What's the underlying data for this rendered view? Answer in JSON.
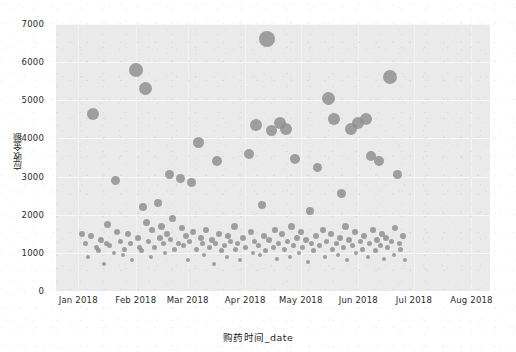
{
  "chart_data": {
    "type": "scatter",
    "title": "",
    "xlabel": "购药时间_date",
    "ylabel": "应收金额",
    "grid": true,
    "legend": "none",
    "marker_color": "#8e8e8e",
    "panel_color": "#eaeaea",
    "figure_color": "#ffffff",
    "xlim": [
      "2017-12-20",
      "2018-08-10"
    ],
    "ylim": [
      0,
      7000
    ],
    "y_ticks": [
      0,
      1000,
      2000,
      3000,
      4000,
      5000,
      6000,
      7000
    ],
    "y_tick_labels": [
      "0",
      "1000",
      "2000",
      "3000",
      "4000",
      "5000",
      "6000",
      "7000"
    ],
    "x_ticks": [
      "2018-01-01",
      "2018-02-01",
      "2018-03-01",
      "2018-04-01",
      "2018-05-01",
      "2018-06-01",
      "2018-07-01",
      "2018-08-01"
    ],
    "x_tick_labels": [
      "Jan 2018",
      "Feb 2018",
      "Mar 2018",
      "Apr 2018",
      "May 2018",
      "Jun 2018",
      "Jul 2018",
      "Aug 2018"
    ],
    "size_encodes": "应收金额",
    "points": [
      {
        "x": 3,
        "y": 1500,
        "s": 6
      },
      {
        "x": 5,
        "y": 1250,
        "s": 5
      },
      {
        "x": 6,
        "y": 900,
        "s": 4
      },
      {
        "x": 8,
        "y": 1450,
        "s": 6
      },
      {
        "x": 9,
        "y": 4650,
        "s": 12
      },
      {
        "x": 11,
        "y": 1150,
        "s": 5
      },
      {
        "x": 12,
        "y": 1050,
        "s": 5
      },
      {
        "x": 13,
        "y": 1350,
        "s": 6
      },
      {
        "x": 15,
        "y": 700,
        "s": 4
      },
      {
        "x": 16,
        "y": 1250,
        "s": 5
      },
      {
        "x": 17,
        "y": 1750,
        "s": 7
      },
      {
        "x": 18,
        "y": 1200,
        "s": 5
      },
      {
        "x": 20,
        "y": 1000,
        "s": 4
      },
      {
        "x": 21,
        "y": 2900,
        "s": 9
      },
      {
        "x": 22,
        "y": 1550,
        "s": 6
      },
      {
        "x": 24,
        "y": 1300,
        "s": 5
      },
      {
        "x": 25,
        "y": 950,
        "s": 4
      },
      {
        "x": 26,
        "y": 1100,
        "s": 5
      },
      {
        "x": 28,
        "y": 1500,
        "s": 6
      },
      {
        "x": 29,
        "y": 1250,
        "s": 5
      },
      {
        "x": 30,
        "y": 800,
        "s": 4
      },
      {
        "x": 32,
        "y": 5800,
        "s": 14
      },
      {
        "x": 33,
        "y": 1400,
        "s": 6
      },
      {
        "x": 34,
        "y": 1150,
        "s": 5
      },
      {
        "x": 35,
        "y": 1050,
        "s": 5
      },
      {
        "x": 36,
        "y": 2200,
        "s": 8
      },
      {
        "x": 37,
        "y": 5300,
        "s": 13
      },
      {
        "x": 38,
        "y": 1800,
        "s": 7
      },
      {
        "x": 39,
        "y": 1300,
        "s": 5
      },
      {
        "x": 40,
        "y": 900,
        "s": 4
      },
      {
        "x": 41,
        "y": 1600,
        "s": 6
      },
      {
        "x": 42,
        "y": 1150,
        "s": 5
      },
      {
        "x": 44,
        "y": 2300,
        "s": 8
      },
      {
        "x": 45,
        "y": 1400,
        "s": 6
      },
      {
        "x": 46,
        "y": 1700,
        "s": 7
      },
      {
        "x": 47,
        "y": 1250,
        "s": 5
      },
      {
        "x": 48,
        "y": 1000,
        "s": 4
      },
      {
        "x": 49,
        "y": 1500,
        "s": 6
      },
      {
        "x": 50,
        "y": 3050,
        "s": 9
      },
      {
        "x": 51,
        "y": 1350,
        "s": 5
      },
      {
        "x": 52,
        "y": 1900,
        "s": 7
      },
      {
        "x": 53,
        "y": 1100,
        "s": 5
      },
      {
        "x": 55,
        "y": 1250,
        "s": 5
      },
      {
        "x": 56,
        "y": 2950,
        "s": 9
      },
      {
        "x": 57,
        "y": 1650,
        "s": 6
      },
      {
        "x": 58,
        "y": 1200,
        "s": 5
      },
      {
        "x": 59,
        "y": 1450,
        "s": 6
      },
      {
        "x": 60,
        "y": 800,
        "s": 4
      },
      {
        "x": 61,
        "y": 1300,
        "s": 5
      },
      {
        "x": 62,
        "y": 2850,
        "s": 9
      },
      {
        "x": 63,
        "y": 1550,
        "s": 6
      },
      {
        "x": 65,
        "y": 1100,
        "s": 5
      },
      {
        "x": 66,
        "y": 3900,
        "s": 11
      },
      {
        "x": 67,
        "y": 1400,
        "s": 6
      },
      {
        "x": 68,
        "y": 1250,
        "s": 5
      },
      {
        "x": 69,
        "y": 950,
        "s": 4
      },
      {
        "x": 70,
        "y": 1600,
        "s": 6
      },
      {
        "x": 72,
        "y": 1150,
        "s": 5
      },
      {
        "x": 73,
        "y": 1350,
        "s": 6
      },
      {
        "x": 74,
        "y": 700,
        "s": 4
      },
      {
        "x": 75,
        "y": 1250,
        "s": 5
      },
      {
        "x": 76,
        "y": 3400,
        "s": 10
      },
      {
        "x": 77,
        "y": 1500,
        "s": 6
      },
      {
        "x": 78,
        "y": 1050,
        "s": 5
      },
      {
        "x": 80,
        "y": 1200,
        "s": 5
      },
      {
        "x": 81,
        "y": 900,
        "s": 4
      },
      {
        "x": 82,
        "y": 1450,
        "s": 6
      },
      {
        "x": 83,
        "y": 1300,
        "s": 5
      },
      {
        "x": 85,
        "y": 1700,
        "s": 7
      },
      {
        "x": 86,
        "y": 1100,
        "s": 5
      },
      {
        "x": 87,
        "y": 1250,
        "s": 5
      },
      {
        "x": 88,
        "y": 800,
        "s": 4
      },
      {
        "x": 90,
        "y": 1400,
        "s": 6
      },
      {
        "x": 91,
        "y": 1150,
        "s": 5
      },
      {
        "x": 93,
        "y": 3600,
        "s": 10
      },
      {
        "x": 94,
        "y": 1550,
        "s": 6
      },
      {
        "x": 95,
        "y": 1000,
        "s": 4
      },
      {
        "x": 96,
        "y": 1300,
        "s": 5
      },
      {
        "x": 97,
        "y": 4350,
        "s": 12
      },
      {
        "x": 98,
        "y": 1200,
        "s": 5
      },
      {
        "x": 99,
        "y": 950,
        "s": 4
      },
      {
        "x": 100,
        "y": 2250,
        "s": 8
      },
      {
        "x": 101,
        "y": 1450,
        "s": 6
      },
      {
        "x": 102,
        "y": 1050,
        "s": 5
      },
      {
        "x": 103,
        "y": 6600,
        "s": 16
      },
      {
        "x": 104,
        "y": 1350,
        "s": 6
      },
      {
        "x": 105,
        "y": 4200,
        "s": 11
      },
      {
        "x": 106,
        "y": 1150,
        "s": 5
      },
      {
        "x": 107,
        "y": 1600,
        "s": 6
      },
      {
        "x": 108,
        "y": 850,
        "s": 4
      },
      {
        "x": 109,
        "y": 1250,
        "s": 5
      },
      {
        "x": 110,
        "y": 4400,
        "s": 12
      },
      {
        "x": 111,
        "y": 1500,
        "s": 6
      },
      {
        "x": 112,
        "y": 1100,
        "s": 5
      },
      {
        "x": 113,
        "y": 4250,
        "s": 12
      },
      {
        "x": 114,
        "y": 1300,
        "s": 5
      },
      {
        "x": 115,
        "y": 900,
        "s": 4
      },
      {
        "x": 116,
        "y": 1700,
        "s": 7
      },
      {
        "x": 117,
        "y": 1200,
        "s": 5
      },
      {
        "x": 118,
        "y": 3450,
        "s": 10
      },
      {
        "x": 119,
        "y": 1400,
        "s": 6
      },
      {
        "x": 120,
        "y": 1000,
        "s": 4
      },
      {
        "x": 121,
        "y": 1550,
        "s": 6
      },
      {
        "x": 122,
        "y": 1150,
        "s": 5
      },
      {
        "x": 124,
        "y": 1350,
        "s": 6
      },
      {
        "x": 125,
        "y": 750,
        "s": 4
      },
      {
        "x": 126,
        "y": 2100,
        "s": 8
      },
      {
        "x": 127,
        "y": 1250,
        "s": 5
      },
      {
        "x": 128,
        "y": 1050,
        "s": 5
      },
      {
        "x": 129,
        "y": 1450,
        "s": 6
      },
      {
        "x": 130,
        "y": 3250,
        "s": 9
      },
      {
        "x": 131,
        "y": 1200,
        "s": 5
      },
      {
        "x": 133,
        "y": 1600,
        "s": 6
      },
      {
        "x": 134,
        "y": 900,
        "s": 4
      },
      {
        "x": 135,
        "y": 1300,
        "s": 5
      },
      {
        "x": 136,
        "y": 5050,
        "s": 13
      },
      {
        "x": 137,
        "y": 1500,
        "s": 6
      },
      {
        "x": 138,
        "y": 1100,
        "s": 5
      },
      {
        "x": 139,
        "y": 4500,
        "s": 12
      },
      {
        "x": 140,
        "y": 1250,
        "s": 5
      },
      {
        "x": 141,
        "y": 950,
        "s": 4
      },
      {
        "x": 142,
        "y": 1400,
        "s": 6
      },
      {
        "x": 143,
        "y": 2550,
        "s": 9
      },
      {
        "x": 144,
        "y": 1150,
        "s": 5
      },
      {
        "x": 145,
        "y": 1700,
        "s": 7
      },
      {
        "x": 146,
        "y": 800,
        "s": 4
      },
      {
        "x": 147,
        "y": 1350,
        "s": 6
      },
      {
        "x": 148,
        "y": 4250,
        "s": 12
      },
      {
        "x": 149,
        "y": 1200,
        "s": 5
      },
      {
        "x": 150,
        "y": 1550,
        "s": 6
      },
      {
        "x": 151,
        "y": 1000,
        "s": 4
      },
      {
        "x": 152,
        "y": 4400,
        "s": 12
      },
      {
        "x": 153,
        "y": 1300,
        "s": 5
      },
      {
        "x": 154,
        "y": 1100,
        "s": 5
      },
      {
        "x": 155,
        "y": 1450,
        "s": 6
      },
      {
        "x": 156,
        "y": 4500,
        "s": 12
      },
      {
        "x": 157,
        "y": 900,
        "s": 4
      },
      {
        "x": 158,
        "y": 1250,
        "s": 5
      },
      {
        "x": 159,
        "y": 3550,
        "s": 10
      },
      {
        "x": 160,
        "y": 1600,
        "s": 6
      },
      {
        "x": 161,
        "y": 1050,
        "s": 5
      },
      {
        "x": 162,
        "y": 1350,
        "s": 6
      },
      {
        "x": 163,
        "y": 3400,
        "s": 10
      },
      {
        "x": 164,
        "y": 1200,
        "s": 5
      },
      {
        "x": 165,
        "y": 1500,
        "s": 6
      },
      {
        "x": 166,
        "y": 850,
        "s": 4
      },
      {
        "x": 167,
        "y": 1400,
        "s": 6
      },
      {
        "x": 168,
        "y": 1150,
        "s": 5
      },
      {
        "x": 169,
        "y": 5600,
        "s": 14
      },
      {
        "x": 170,
        "y": 1300,
        "s": 5
      },
      {
        "x": 171,
        "y": 950,
        "s": 4
      },
      {
        "x": 172,
        "y": 1650,
        "s": 6
      },
      {
        "x": 173,
        "y": 3050,
        "s": 9
      },
      {
        "x": 174,
        "y": 1250,
        "s": 5
      },
      {
        "x": 175,
        "y": 1100,
        "s": 5
      },
      {
        "x": 176,
        "y": 1450,
        "s": 6
      },
      {
        "x": 177,
        "y": 800,
        "s": 4
      }
    ]
  }
}
